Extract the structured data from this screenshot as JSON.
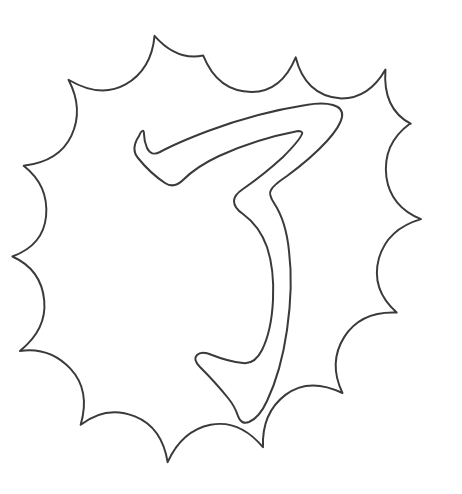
{
  "page": {
    "kind": "coloring-page-line-art",
    "width": 462,
    "height": 494,
    "background_color": "#ffffff",
    "has_visible_text": false
  },
  "style": {
    "stroke_color": "#3a3a3a",
    "stroke_width": 2.1,
    "inner_stroke_width": 2.0,
    "fill_color": "none"
  },
  "artwork": {
    "name": "katakana-fu-in-starburst-badge",
    "description": "Outlined katakana character inside a scalloped starburst frame",
    "elements": [
      {
        "name": "starburst-frame",
        "role": "decorative-border",
        "spike_count": 14,
        "center": [
          234,
          249
        ],
        "outer_radius": 212,
        "inner_radius": 158
      },
      {
        "name": "character-glyph",
        "role": "coloring-subject",
        "glyph": "フ",
        "script": "katakana",
        "romaji": "fu",
        "stroke_count": 1
      }
    ]
  },
  "geometry": {
    "starburst_points": [
      [
        234,
        37
      ],
      [
        272,
        38
      ],
      [
        310,
        63
      ],
      [
        352,
        55
      ],
      [
        366,
        90
      ],
      [
        408,
        100
      ],
      [
        404,
        140
      ],
      [
        436,
        170
      ],
      [
        414,
        205
      ],
      [
        435,
        240
      ],
      [
        404,
        268
      ],
      [
        421,
        305
      ],
      [
        386,
        320
      ],
      [
        390,
        360
      ],
      [
        350,
        362
      ],
      [
        340,
        400
      ],
      [
        302,
        392
      ],
      [
        280,
        424
      ],
      [
        246,
        408
      ],
      [
        214,
        430
      ],
      [
        190,
        400
      ],
      [
        150,
        410
      ],
      [
        140,
        372
      ],
      [
        100,
        372
      ],
      [
        104,
        333
      ],
      [
        66,
        318
      ],
      [
        82,
        281
      ],
      [
        48,
        258
      ],
      [
        75,
        228
      ],
      [
        50,
        196
      ],
      [
        83,
        174
      ],
      [
        72,
        134
      ],
      [
        111,
        130
      ],
      [
        115,
        90
      ],
      [
        152,
        98
      ],
      [
        172,
        63
      ],
      [
        206,
        78
      ]
    ],
    "glyph_outline_note": "Closed outline path of the katakana stroke, drawn as a hollow contour"
  },
  "accessibility": {
    "alt_text": "Black and white coloring page showing the outlined katakana character fu inside a scalloped starburst frame"
  }
}
